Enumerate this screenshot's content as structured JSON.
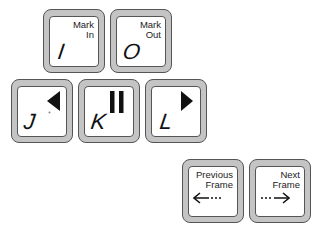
{
  "keys": {
    "i": {
      "letter": "I",
      "legend_line1": "Mark",
      "legend_line2": "In"
    },
    "o": {
      "letter": "O",
      "legend_line1": "Mark",
      "legend_line2": "Out"
    },
    "j": {
      "letter": "J",
      "icon": "play-reverse-icon"
    },
    "k": {
      "letter": "K",
      "icon": "pause-icon"
    },
    "l": {
      "letter": "L",
      "icon": "play-forward-icon"
    },
    "prev": {
      "legend_line1": "Previous",
      "legend_line2": "Frame",
      "icon": "arrow-left-icon"
    },
    "next": {
      "legend_line1": "Next",
      "legend_line2": "Frame",
      "icon": "arrow-right-icon"
    }
  },
  "colors": {
    "key_frame": "#c4c4c4",
    "key_face": "#ffffff",
    "outline": "#555555",
    "ink": "#111111"
  }
}
